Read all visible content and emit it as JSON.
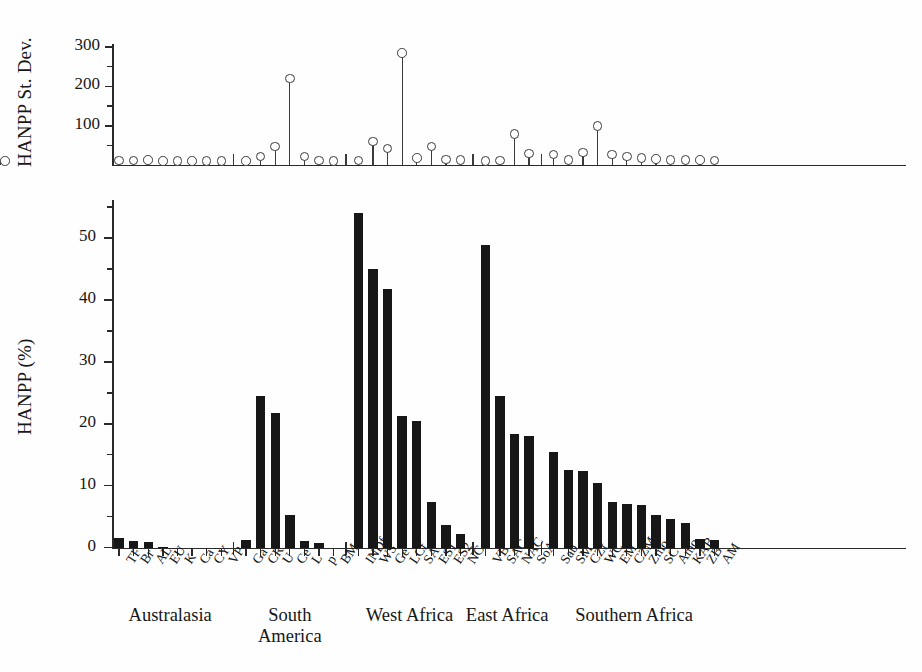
{
  "chart_data": {
    "type": "bar",
    "title": "",
    "panels": [
      {
        "id": "upper",
        "type": "stem",
        "ylabel": "HANPP St. Dev.",
        "ytick_labels": [
          "100",
          "200",
          "300"
        ],
        "ytick_values": [
          100,
          200,
          300
        ],
        "ylim": [
          0,
          340
        ],
        "grid": false,
        "marker": "open-circle"
      },
      {
        "id": "lower",
        "type": "bar",
        "ylabel": "HANPP (%)",
        "ytick_labels": [
          "0",
          "10",
          "20",
          "30",
          "40",
          "50"
        ],
        "ytick_values": [
          0,
          10,
          20,
          30,
          40,
          50
        ],
        "ylim": [
          0,
          57
        ],
        "grid": false
      }
    ],
    "xlabel": "",
    "groups": [
      {
        "label": "Australasia",
        "lines": [
          "Australasia"
        ]
      },
      {
        "label": "South America",
        "lines": [
          "South",
          "America"
        ]
      },
      {
        "label": "West Africa",
        "lines": [
          "West Africa"
        ]
      },
      {
        "label": "East Africa",
        "lines": [
          "East Africa"
        ]
      },
      {
        "label": "Southern Africa",
        "lines": [
          "Southern Africa"
        ]
      }
    ],
    "categories": [
      "TF",
      "Br",
      "AL",
      "EU",
      "K",
      "Ca",
      "CY",
      "VP",
      "Ga",
      "CR",
      "U",
      "Ce",
      "L",
      "p",
      "BM",
      "INDf",
      "WS",
      "Ge",
      "LCf",
      "SA",
      "ES1",
      "ES2",
      "NC",
      "VB",
      "SAC",
      "NAC",
      "SoA",
      "Sab",
      "SM",
      "CZf",
      "WC",
      "EM",
      "CZM",
      "Zmo",
      "SC",
      "Amo",
      "KAB",
      "ZB",
      "AM"
    ],
    "category_group_index": [
      0,
      0,
      0,
      0,
      0,
      0,
      0,
      0,
      1,
      1,
      1,
      1,
      1,
      1,
      1,
      2,
      2,
      2,
      2,
      2,
      2,
      2,
      2,
      3,
      3,
      3,
      3,
      4,
      4,
      4,
      4,
      4,
      4,
      4,
      4,
      4,
      4,
      4,
      4
    ],
    "hanpp_percent": [
      1.5,
      1.1,
      0.9,
      0.15,
      0.1,
      0.08,
      0.06,
      0.05,
      1.2,
      24.5,
      21.8,
      5.3,
      1.1,
      0.7,
      0.1,
      54.0,
      45.0,
      41.8,
      21.3,
      20.5,
      7.3,
      3.7,
      2.2,
      48.8,
      24.5,
      18.3,
      18.1,
      15.5,
      12.6,
      12.4,
      10.5,
      7.3,
      7.1,
      6.8,
      5.3,
      4.6,
      3.9,
      1.4,
      1.3
    ],
    "hanpp_stdev": [
      12,
      12,
      14,
      11,
      11,
      11,
      11,
      11,
      11,
      22,
      48,
      220,
      22,
      12,
      11,
      12,
      60,
      43,
      285,
      18,
      48,
      15,
      13,
      11,
      12,
      80,
      30,
      27,
      13,
      32,
      100,
      27,
      22,
      18,
      16,
      14,
      13,
      14,
      12,
      11
    ]
  },
  "titles": {
    "stdev_axis": "HANPP St. Dev.",
    "hanpp_axis": "HANPP (%)"
  }
}
